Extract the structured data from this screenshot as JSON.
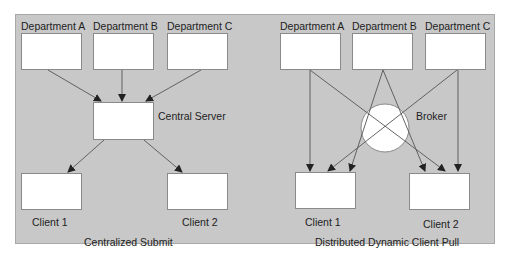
{
  "colors": {
    "panel_background": "#c8c8c8",
    "node_fill": "#ffffff",
    "line": "#555555",
    "text": "#222222"
  },
  "left_diagram": {
    "caption": "Centralized Submit",
    "departments": [
      {
        "label": "Department A"
      },
      {
        "label": "Department B"
      },
      {
        "label": "Department C"
      }
    ],
    "server": {
      "label": "Central Server"
    },
    "clients": [
      {
        "label": "Client 1"
      },
      {
        "label": "Client 2"
      }
    ],
    "edges": [
      {
        "from": "Department A",
        "to": "Central Server"
      },
      {
        "from": "Department B",
        "to": "Central Server"
      },
      {
        "from": "Department C",
        "to": "Central Server"
      },
      {
        "from": "Central Server",
        "to": "Client 1"
      },
      {
        "from": "Central Server",
        "to": "Client 2"
      }
    ]
  },
  "right_diagram": {
    "caption": "Distributed Dynamic Client Pull",
    "departments": [
      {
        "label": "Department A"
      },
      {
        "label": "Department B"
      },
      {
        "label": "Department C"
      }
    ],
    "broker": {
      "label": "Broker"
    },
    "clients": [
      {
        "label": "Client 1"
      },
      {
        "label": "Client 2"
      }
    ],
    "edges": [
      {
        "from": "Department A",
        "to": "Client 1"
      },
      {
        "from": "Department A",
        "to": "Client 2"
      },
      {
        "from": "Department B",
        "to": "Client 1"
      },
      {
        "from": "Department B",
        "to": "Client 2"
      },
      {
        "from": "Department C",
        "to": "Client 1"
      },
      {
        "from": "Department C",
        "to": "Client 2"
      }
    ]
  }
}
